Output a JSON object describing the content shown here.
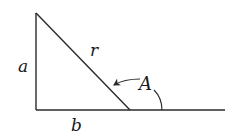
{
  "diagram": {
    "type": "right-triangle",
    "colors": {
      "stroke": "#2a2a2a",
      "text": "#1a1a1a",
      "background": "#ffffff"
    },
    "labels": {
      "vertical_side": "a",
      "base_side": "b",
      "hypotenuse": "r",
      "angle": "A"
    },
    "points": {
      "top": [
        36,
        13
      ],
      "right_angle": [
        36,
        110
      ],
      "hyp_foot": [
        130,
        110
      ],
      "baseline_end": [
        225,
        110
      ]
    }
  }
}
